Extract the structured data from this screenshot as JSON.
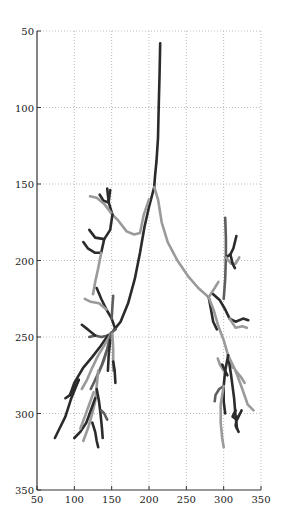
{
  "chart_data": {
    "type": "line",
    "title": "",
    "xlabel": "",
    "ylabel": "",
    "xlim": [
      50,
      350
    ],
    "ylim": [
      350,
      50
    ],
    "y_inverted": true,
    "grid": true,
    "grid_style": "dotted",
    "legend": null,
    "x_ticks": [
      50,
      100,
      150,
      200,
      250,
      300,
      350
    ],
    "y_ticks": [
      50,
      100,
      150,
      200,
      250,
      300,
      350
    ],
    "colors": {
      "dark": "#2b2b2b",
      "medium": "#5e5e5e",
      "light": "#9a9a9a",
      "axis": "#333333",
      "grid": "#bbbbbb"
    },
    "series": [
      {
        "name": "trunk",
        "shade": "dark",
        "points": [
          [
            215,
            58
          ],
          [
            214,
            80
          ],
          [
            213,
            100
          ],
          [
            212,
            120
          ],
          [
            210,
            135
          ],
          [
            208,
            145
          ],
          [
            207,
            152
          ]
        ]
      },
      {
        "name": "left-main",
        "shade": "dark",
        "points": [
          [
            207,
            152
          ],
          [
            200,
            165
          ],
          [
            194,
            178
          ],
          [
            188,
            195
          ],
          [
            181,
            212
          ],
          [
            172,
            228
          ],
          [
            162,
            240
          ],
          [
            152,
            246
          ]
        ]
      },
      {
        "name": "right-main",
        "shade": "light",
        "points": [
          [
            207,
            152
          ],
          [
            212,
            160
          ],
          [
            217,
            175
          ],
          [
            225,
            188
          ],
          [
            238,
            200
          ],
          [
            252,
            210
          ],
          [
            266,
            218
          ],
          [
            280,
            224
          ]
        ]
      },
      {
        "name": "left-upper-light",
        "shade": "light",
        "points": [
          [
            200,
            160
          ],
          [
            193,
            170
          ],
          [
            188,
            182
          ],
          [
            180,
            183
          ],
          [
            170,
            181
          ],
          [
            159,
            174
          ],
          [
            151,
            170
          ]
        ]
      },
      {
        "name": "left-upper-twig-a",
        "shade": "dark",
        "points": [
          [
            151,
            170
          ],
          [
            146,
            162
          ],
          [
            144,
            153
          ]
        ]
      },
      {
        "name": "left-upper-twig-b",
        "shade": "dark",
        "points": [
          [
            146,
            162
          ],
          [
            139,
            161
          ],
          [
            134,
            157
          ]
        ]
      },
      {
        "name": "left-upper-twig-c",
        "shade": "light",
        "points": [
          [
            151,
            170
          ],
          [
            140,
            163
          ],
          [
            130,
            159
          ],
          [
            121,
            158
          ]
        ]
      },
      {
        "name": "left-upper-twig-d",
        "shade": "dark",
        "points": [
          [
            146,
            162
          ],
          [
            147,
            158
          ],
          [
            148,
            154
          ]
        ]
      },
      {
        "name": "left-mid-branch",
        "shade": "dark",
        "points": [
          [
            151,
            170
          ],
          [
            148,
            180
          ],
          [
            140,
            186
          ],
          [
            128,
            185
          ],
          [
            120,
            180
          ]
        ]
      },
      {
        "name": "left-mid-branch-2",
        "shade": "dark",
        "points": [
          [
            140,
            186
          ],
          [
            136,
            195
          ],
          [
            128,
            195
          ],
          [
            118,
            192
          ],
          [
            112,
            188
          ]
        ]
      },
      {
        "name": "left-mid-light",
        "shade": "light",
        "points": [
          [
            136,
            195
          ],
          [
            132,
            205
          ],
          [
            128,
            214
          ],
          [
            125,
            222
          ]
        ]
      },
      {
        "name": "left-lower-a",
        "shade": "dark",
        "points": [
          [
            155,
            245
          ],
          [
            150,
            238
          ],
          [
            143,
            232
          ],
          [
            136,
            225
          ],
          [
            130,
            218
          ]
        ]
      },
      {
        "name": "left-lower-a-light",
        "shade": "light",
        "points": [
          [
            143,
            232
          ],
          [
            133,
            228
          ],
          [
            122,
            227
          ],
          [
            114,
            225
          ]
        ]
      },
      {
        "name": "left-lower-a-twig",
        "shade": "medium",
        "points": [
          [
            150,
            238
          ],
          [
            151,
            230
          ],
          [
            152,
            223
          ]
        ]
      },
      {
        "name": "left-lower-trunk",
        "shade": "medium",
        "points": [
          [
            155,
            245
          ],
          [
            150,
            247
          ],
          [
            145,
            249
          ]
        ]
      },
      {
        "name": "left-lower-hz",
        "shade": "medium",
        "points": [
          [
            145,
            249
          ],
          [
            136,
            250
          ],
          [
            128,
            249
          ],
          [
            120,
            250
          ]
        ]
      },
      {
        "name": "left-lower-bent",
        "shade": "dark",
        "points": [
          [
            128,
            249
          ],
          [
            118,
            245
          ],
          [
            110,
            242
          ]
        ]
      },
      {
        "name": "left-lower-far",
        "shade": "dark",
        "points": [
          [
            145,
            249
          ],
          [
            135,
            256
          ],
          [
            124,
            263
          ],
          [
            112,
            270
          ],
          [
            100,
            280
          ],
          [
            94,
            288
          ],
          [
            88,
            290
          ]
        ]
      },
      {
        "name": "left-lower-far-2",
        "shade": "dark",
        "points": [
          [
            94,
            288
          ],
          [
            100,
            283
          ],
          [
            106,
            278
          ]
        ]
      },
      {
        "name": "left-lower-far-3",
        "shade": "dark",
        "points": [
          [
            106,
            278
          ],
          [
            96,
            290
          ],
          [
            88,
            302
          ],
          [
            80,
            310
          ],
          [
            74,
            316
          ]
        ]
      },
      {
        "name": "left-lower-light-1",
        "shade": "light",
        "points": [
          [
            150,
            247
          ],
          [
            142,
            254
          ],
          [
            132,
            262
          ],
          [
            124,
            270
          ],
          [
            117,
            278
          ],
          [
            110,
            284
          ]
        ]
      },
      {
        "name": "left-lower-light-2",
        "shade": "light",
        "points": [
          [
            150,
            247
          ],
          [
            145,
            256
          ],
          [
            140,
            265
          ],
          [
            134,
            272
          ],
          [
            128,
            278
          ]
        ]
      },
      {
        "name": "left-lower-med",
        "shade": "medium",
        "points": [
          [
            150,
            247
          ],
          [
            144,
            258
          ],
          [
            137,
            268
          ],
          [
            130,
            276
          ],
          [
            122,
            284
          ]
        ]
      },
      {
        "name": "left-lower-right-dark",
        "shade": "dark",
        "points": [
          [
            148,
            252
          ],
          [
            146,
            262
          ],
          [
            145,
            272
          ]
        ]
      },
      {
        "name": "left-lower-right-light",
        "shade": "light",
        "points": [
          [
            151,
            248
          ],
          [
            152,
            258
          ],
          [
            152,
            266
          ],
          [
            152,
            272
          ]
        ]
      },
      {
        "name": "left-lower-right-tip",
        "shade": "dark",
        "points": [
          [
            152,
            266
          ],
          [
            154,
            272
          ],
          [
            155,
            280
          ]
        ]
      },
      {
        "name": "left-bottom-trunk",
        "shade": "light",
        "points": [
          [
            132,
            272
          ],
          [
            130,
            282
          ],
          [
            128,
            292
          ],
          [
            124,
            300
          ],
          [
            118,
            310
          ],
          [
            112,
            318
          ]
        ]
      },
      {
        "name": "left-bottom-dark-a",
        "shade": "dark",
        "points": [
          [
            128,
            290
          ],
          [
            122,
            298
          ],
          [
            116,
            306
          ],
          [
            108,
            312
          ],
          [
            100,
            316
          ]
        ]
      },
      {
        "name": "left-bottom-dark-b",
        "shade": "dark",
        "points": [
          [
            130,
            284
          ],
          [
            133,
            292
          ],
          [
            135,
            300
          ],
          [
            137,
            310
          ],
          [
            138,
            316
          ]
        ]
      },
      {
        "name": "left-bottom-dark-c",
        "shade": "dark",
        "points": [
          [
            124,
            306
          ],
          [
            128,
            312
          ],
          [
            130,
            318
          ],
          [
            132,
            322
          ]
        ]
      },
      {
        "name": "left-bottom-twig",
        "shade": "medium",
        "points": [
          [
            136,
            298
          ],
          [
            140,
            300
          ],
          [
            144,
            304
          ]
        ]
      },
      {
        "name": "left-bottom-light-b",
        "shade": "light",
        "points": [
          [
            126,
            286
          ],
          [
            120,
            294
          ],
          [
            114,
            302
          ],
          [
            108,
            310
          ]
        ]
      },
      {
        "name": "right-upper-stem",
        "shade": "medium",
        "points": [
          [
            300,
            225
          ],
          [
            302,
            212
          ],
          [
            303,
            198
          ],
          [
            303,
            185
          ],
          [
            302,
            172
          ]
        ]
      },
      {
        "name": "right-upper-dark",
        "shade": "dark",
        "points": [
          [
            303,
            198
          ],
          [
            309,
            196
          ],
          [
            313,
            192
          ],
          [
            317,
            184
          ]
        ]
      },
      {
        "name": "right-upper-light",
        "shade": "light",
        "points": [
          [
            303,
            198
          ],
          [
            310,
            202
          ],
          [
            316,
            202
          ],
          [
            321,
            198
          ]
        ]
      },
      {
        "name": "right-upper-twig",
        "shade": "dark",
        "points": [
          [
            309,
            196
          ],
          [
            312,
            202
          ],
          [
            315,
            205
          ]
        ]
      },
      {
        "name": "right-mid-junction",
        "shade": "dark",
        "points": [
          [
            280,
            224
          ],
          [
            283,
            232
          ],
          [
            286,
            240
          ],
          [
            291,
            245
          ]
        ]
      },
      {
        "name": "right-mid-light-a",
        "shade": "light",
        "points": [
          [
            280,
            224
          ],
          [
            288,
            218
          ],
          [
            293,
            214
          ]
        ]
      },
      {
        "name": "right-mid-dark-b",
        "shade": "dark",
        "points": [
          [
            286,
            222
          ],
          [
            295,
            226
          ],
          [
            302,
            232
          ],
          [
            308,
            238
          ],
          [
            316,
            240
          ],
          [
            326,
            238
          ],
          [
            333,
            239
          ]
        ]
      },
      {
        "name": "right-mid-light-b",
        "shade": "light",
        "points": [
          [
            308,
            238
          ],
          [
            316,
            244
          ],
          [
            325,
            243
          ],
          [
            331,
            244
          ]
        ]
      },
      {
        "name": "right-lower-main",
        "shade": "light",
        "points": [
          [
            280,
            224
          ],
          [
            287,
            233
          ],
          [
            293,
            243
          ],
          [
            300,
            252
          ],
          [
            306,
            262
          ],
          [
            312,
            270
          ]
        ]
      },
      {
        "name": "right-lower-dark",
        "shade": "dark",
        "points": [
          [
            306,
            262
          ],
          [
            310,
            275
          ],
          [
            314,
            290
          ],
          [
            316,
            302
          ],
          [
            318,
            310
          ]
        ]
      },
      {
        "name": "right-lower-light-r",
        "shade": "light",
        "points": [
          [
            306,
            262
          ],
          [
            316,
            272
          ],
          [
            325,
            284
          ],
          [
            332,
            294
          ],
          [
            340,
            298
          ]
        ]
      },
      {
        "name": "right-lower-light-tip",
        "shade": "light",
        "points": [
          [
            316,
            272
          ],
          [
            323,
            276
          ],
          [
            328,
            280
          ]
        ]
      },
      {
        "name": "right-lower-left-dark",
        "shade": "dark",
        "points": [
          [
            306,
            262
          ],
          [
            302,
            272
          ],
          [
            300,
            282
          ],
          [
            300,
            292
          ],
          [
            302,
            300
          ]
        ]
      },
      {
        "name": "right-lower-left-med",
        "shade": "medium",
        "points": [
          [
            300,
            282
          ],
          [
            294,
            284
          ],
          [
            289,
            288
          ],
          [
            288,
            292
          ]
        ]
      },
      {
        "name": "right-lower-left-light",
        "shade": "light",
        "points": [
          [
            300,
            282
          ],
          [
            296,
            294
          ],
          [
            296,
            306
          ],
          [
            298,
            316
          ],
          [
            300,
            322
          ]
        ]
      },
      {
        "name": "right-lower-cluster",
        "shade": "dark",
        "points": [
          [
            316,
            298
          ],
          [
            312,
            302
          ],
          [
            318,
            304
          ],
          [
            322,
            300
          ],
          [
            324,
            298
          ]
        ]
      },
      {
        "name": "right-lower-cluster-2",
        "shade": "dark",
        "points": [
          [
            318,
            302
          ],
          [
            316,
            308
          ],
          [
            320,
            312
          ]
        ]
      },
      {
        "name": "right-lower-mid-light",
        "shade": "light",
        "points": [
          [
            300,
            272
          ],
          [
            295,
            268
          ],
          [
            292,
            264
          ]
        ]
      },
      {
        "name": "right-lower-mid-dark",
        "shade": "dark",
        "points": [
          [
            298,
            268
          ],
          [
            302,
            272
          ],
          [
            305,
            275
          ]
        ]
      }
    ]
  }
}
